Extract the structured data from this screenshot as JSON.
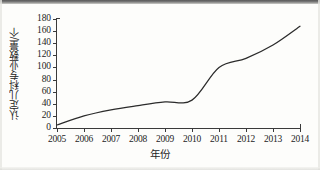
{
  "figure": {
    "background_color": "#fdfdfb",
    "line_color": "#2b2b2b",
    "axis_color": "#3a3a3a",
    "text_color": "#242424"
  },
  "chart_data": {
    "type": "line",
    "title": "",
    "xlabel": "年份",
    "ylabel": "认定儿科专业数量/个",
    "categories": [
      "2005",
      "2006",
      "2007",
      "2008",
      "2009",
      "2010",
      "2011",
      "2012",
      "2013",
      "2014"
    ],
    "x": [
      2005,
      2006,
      2007,
      2008,
      2009,
      2010,
      2011,
      2012,
      2013,
      2014
    ],
    "values": [
      5,
      20,
      30,
      37,
      43,
      46,
      100,
      115,
      137,
      168
    ],
    "series": [
      {
        "name": "认定儿科专业数量",
        "values": [
          5,
          20,
          30,
          37,
          43,
          46,
          100,
          115,
          137,
          168
        ]
      }
    ],
    "xlim": [
      2005,
      2014
    ],
    "ylim": [
      0,
      180
    ],
    "ytick_labels": [
      "0",
      "20",
      "40",
      "60",
      "80",
      "100",
      "120",
      "140",
      "160",
      "180"
    ],
    "ytick_values": [
      0,
      20,
      40,
      60,
      80,
      100,
      120,
      140,
      160,
      180
    ],
    "xtick_labels": [
      "2005",
      "2006",
      "2007",
      "2008",
      "2009",
      "2010",
      "2011",
      "2012",
      "2013",
      "2014"
    ],
    "grid": false,
    "legend": false,
    "legend_position": "none",
    "smoothed": true,
    "markers": false
  }
}
